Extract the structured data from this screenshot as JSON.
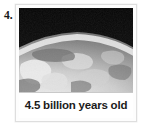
{
  "question": {
    "number_label": "4."
  },
  "card": {
    "image": {
      "alt_name": "earth-from-space-photo",
      "description": "Grayscale photograph of a planet limb lit against dark space",
      "space_color": "#0b0b0b",
      "terrain_light_color": "#e8e8e8",
      "terrain_mid_color": "#9a9a9a",
      "terrain_dark_color": "#4a4a4a",
      "limb_glow_color": "#f2f2f2"
    },
    "caption": "4.5 billion years old",
    "frame_color": "#dedede",
    "background_color": "#ffffff"
  }
}
